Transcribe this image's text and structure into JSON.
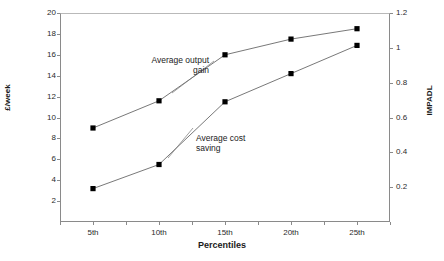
{
  "top_clipped_text": "",
  "chart_data": {
    "type": "line",
    "title": "",
    "xlabel": "Percentiles",
    "ylabel": "£/week",
    "y2label": "IMPADL",
    "categories": [
      "5th",
      "10th",
      "15th",
      "20th",
      "25th"
    ],
    "ylim": [
      0,
      20
    ],
    "yticks": [
      "0",
      "2",
      "4",
      "6",
      "8",
      "10",
      "12",
      "14",
      "16",
      "18",
      "20"
    ],
    "y2lim": [
      0,
      1.2
    ],
    "y2ticks": [
      "0",
      "0.2",
      "0.4",
      "0.6",
      "0.8",
      "1",
      "1.2"
    ],
    "grid": false,
    "legend": "none (inline annotations)",
    "marker": "filled-square",
    "line_color": "#555555",
    "marker_color": "#000000",
    "series": [
      {
        "name": "Average output gain",
        "axis": "left",
        "values": [
          9.0,
          11.6,
          16.0,
          17.5,
          18.5
        ]
      },
      {
        "name": "Average cost saving",
        "axis": "left",
        "values": [
          3.2,
          5.5,
          11.5,
          14.2,
          16.9
        ]
      }
    ],
    "annotations": [
      {
        "text": "Average output\ngain",
        "series": "Average output gain"
      },
      {
        "text": "Average cost\nsaving",
        "series": "Average cost saving"
      }
    ]
  }
}
